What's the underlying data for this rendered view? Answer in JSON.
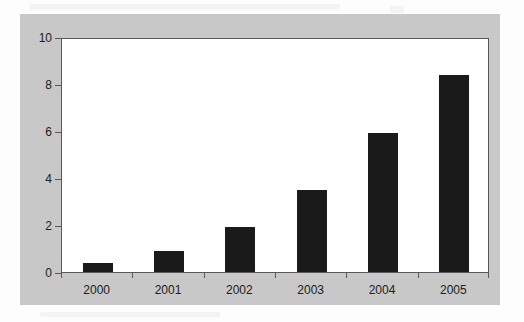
{
  "chart_data": {
    "type": "bar",
    "title": "",
    "subtitle": "",
    "xlabel": "",
    "ylabel": "",
    "categories": [
      "2000",
      "2001",
      "2002",
      "2003",
      "2004",
      "2005"
    ],
    "values": [
      0.4,
      0.9,
      1.9,
      3.5,
      5.9,
      8.4
    ],
    "ylim": [
      0,
      10
    ],
    "yticks": [
      0,
      2,
      4,
      6,
      8,
      10
    ],
    "ytick_labels": [
      "0",
      "2",
      "4",
      "6",
      "8",
      "10"
    ],
    "grid": false,
    "legend": null,
    "legend_position": "none",
    "annotations": [],
    "series": [
      {
        "name": "",
        "values": [
          0.4,
          0.9,
          1.9,
          3.5,
          5.9,
          8.4
        ],
        "color": "#1a1a1a"
      }
    ]
  },
  "figure": {
    "panel_color": "#c8c8c8",
    "plot_background": "#ffffff",
    "axis_color": "#58585a",
    "bar_color": "#1a1a1a",
    "text_color": "#202020"
  }
}
